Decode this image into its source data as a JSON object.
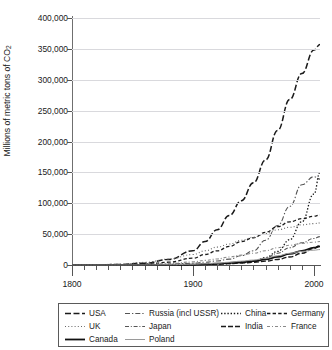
{
  "title": "",
  "axes": {
    "ylabel_pre": "Millions of metric tons of CO",
    "ylabel_sub": "2",
    "yticks": [
      "0",
      "50,000",
      "100,000",
      "150,000",
      "200,000",
      "250,000",
      "300,000",
      "350,000",
      "400,000"
    ],
    "xticks": [
      "1800",
      "1900",
      "2000"
    ]
  },
  "legend": {
    "items": [
      {
        "label": "USA",
        "style": "dashdash"
      },
      {
        "label": "Russia (incl USSR)",
        "style": "dashdot"
      },
      {
        "label": "China",
        "style": "dotted"
      },
      {
        "label": "Germany",
        "style": "dashed"
      },
      {
        "label": "UK",
        "style": "finedot"
      },
      {
        "label": "Japan",
        "style": "dashdotdot"
      },
      {
        "label": "India",
        "style": "dashdash2"
      },
      {
        "label": "France",
        "style": "dashdotgray"
      },
      {
        "label": "Canada",
        "style": "solidthick"
      },
      {
        "label": "Poland",
        "style": "solidthin"
      }
    ]
  },
  "chart_data": {
    "type": "line",
    "title": "",
    "xlabel": "",
    "ylabel": "Millions of metric tons of CO2",
    "xlim": [
      1800,
      2005
    ],
    "ylim": [
      0,
      400000
    ],
    "ytick_step": 50000,
    "grid": true,
    "legend_position": "below-plot",
    "x": [
      1800,
      1820,
      1840,
      1860,
      1880,
      1900,
      1910,
      1920,
      1930,
      1940,
      1950,
      1960,
      1970,
      1980,
      1990,
      2000,
      2005
    ],
    "series": [
      {
        "name": "USA",
        "style": "dashdash",
        "color": "#1a1a1a",
        "values": [
          0,
          200,
          900,
          3000,
          9000,
          23000,
          38000,
          57000,
          80000,
          104000,
          133000,
          170000,
          218000,
          268000,
          310000,
          348000,
          357000
        ]
      },
      {
        "name": "Russia (incl USSR)",
        "style": "dashdot",
        "color": "#555555",
        "values": [
          0,
          30,
          120,
          400,
          1200,
          2800,
          4500,
          6500,
          9500,
          15000,
          23000,
          40000,
          64000,
          95000,
          130000,
          143000,
          139000
        ]
      },
      {
        "name": "China",
        "style": "dotted",
        "color": "#1a1a1a",
        "values": [
          0,
          10,
          30,
          80,
          200,
          500,
          800,
          1300,
          2200,
          3600,
          5500,
          12000,
          22000,
          41000,
          70000,
          115000,
          150000
        ]
      },
      {
        "name": "Germany",
        "style": "dashed",
        "color": "#1a1a1a",
        "values": [
          0,
          80,
          400,
          1500,
          4500,
          11000,
          17000,
          23000,
          30000,
          38000,
          44000,
          53000,
          62000,
          70000,
          75000,
          79000,
          81000
        ]
      },
      {
        "name": "UK",
        "style": "finedot",
        "color": "#666666",
        "values": [
          0,
          400,
          1500,
          4200,
          9500,
          17000,
          23000,
          29000,
          34000,
          40000,
          45000,
          51000,
          57000,
          61000,
          65000,
          67000,
          68000
        ]
      },
      {
        "name": "Japan",
        "style": "dashdotdot",
        "color": "#555555",
        "values": [
          0,
          5,
          15,
          40,
          150,
          500,
          900,
          1700,
          3000,
          5000,
          7000,
          11000,
          19000,
          28000,
          36000,
          43000,
          46000
        ]
      },
      {
        "name": "India",
        "style": "dashdash2",
        "color": "#1a1a1a",
        "values": [
          0,
          5,
          15,
          50,
          150,
          450,
          800,
          1400,
          2200,
          3200,
          4300,
          6200,
          9000,
          13000,
          19000,
          27000,
          32000
        ]
      },
      {
        "name": "France",
        "style": "dashdotgray",
        "color": "#8a8a8a",
        "values": [
          0,
          60,
          250,
          900,
          2400,
          5000,
          7500,
          9800,
          13000,
          16000,
          19000,
          23000,
          28000,
          32000,
          35000,
          37000,
          38000
        ]
      },
      {
        "name": "Canada",
        "style": "solidthick",
        "color": "#111111",
        "values": [
          0,
          5,
          20,
          70,
          250,
          700,
          1300,
          2200,
          3400,
          4700,
          6300,
          9000,
          13000,
          18000,
          23000,
          28000,
          30000
        ]
      },
      {
        "name": "Poland",
        "style": "solidthin",
        "color": "#9a9a9a",
        "values": [
          0,
          10,
          40,
          150,
          450,
          1200,
          2000,
          3000,
          4500,
          6200,
          8000,
          11000,
          15000,
          19000,
          22000,
          24000,
          25000
        ]
      }
    ]
  }
}
